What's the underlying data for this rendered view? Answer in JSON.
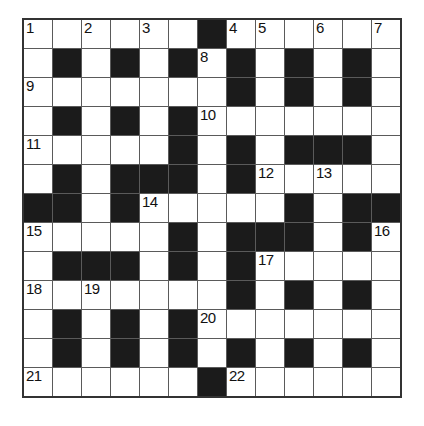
{
  "puzzle": {
    "type": "crossword",
    "rows": 13,
    "cols": 13,
    "black_marker": "#",
    "grid": [
      [
        "1",
        "",
        "2",
        "",
        "3",
        "",
        "#",
        "4",
        "5",
        "",
        "6",
        "",
        "7"
      ],
      [
        "",
        "#",
        "",
        "#",
        "",
        "#",
        "8",
        "#",
        "",
        "#",
        "",
        "#",
        ""
      ],
      [
        "9",
        "",
        "",
        "",
        "",
        "",
        "",
        "#",
        "",
        "#",
        "",
        "#",
        ""
      ],
      [
        "",
        "#",
        "",
        "#",
        "",
        "#",
        "10",
        "",
        "",
        "",
        "",
        "",
        ""
      ],
      [
        "11",
        "",
        "",
        "",
        "",
        "#",
        "",
        "#",
        "",
        "#",
        "#",
        "#",
        ""
      ],
      [
        "",
        "#",
        "",
        "#",
        "#",
        "#",
        "",
        "#",
        "12",
        "",
        "13",
        "",
        ""
      ],
      [
        "#",
        "#",
        "",
        "#",
        "14",
        "",
        "",
        "",
        "",
        "#",
        "",
        "#",
        "#"
      ],
      [
        "15",
        "",
        "",
        "",
        "",
        "#",
        "",
        "#",
        "#",
        "#",
        "",
        "#",
        "16"
      ],
      [
        "",
        "#",
        "#",
        "#",
        "",
        "#",
        "",
        "#",
        "17",
        "",
        "",
        "",
        ""
      ],
      [
        "18",
        "",
        "19",
        "",
        "",
        "",
        "",
        "#",
        "",
        "#",
        "",
        "#",
        ""
      ],
      [
        "",
        "#",
        "",
        "#",
        "",
        "#",
        "20",
        "",
        "",
        "",
        "",
        "",
        ""
      ],
      [
        "",
        "#",
        "",
        "#",
        "",
        "#",
        "",
        "#",
        "",
        "#",
        "",
        "#",
        ""
      ],
      [
        "21",
        "",
        "",
        "",
        "",
        "",
        "#",
        "22",
        "",
        "",
        "",
        "",
        ""
      ]
    ],
    "clue_numbers": [
      "1",
      "2",
      "3",
      "4",
      "5",
      "6",
      "7",
      "8",
      "9",
      "10",
      "11",
      "12",
      "13",
      "14",
      "15",
      "16",
      "17",
      "18",
      "19",
      "20",
      "21",
      "22"
    ],
    "colors": {
      "page_background": "#ffffff",
      "grid_line": "#5a5a5a",
      "outer_border": "#333333",
      "black_cell": "#1b1b1b",
      "white_cell": "#ffffff",
      "number_text": "#111111"
    }
  }
}
